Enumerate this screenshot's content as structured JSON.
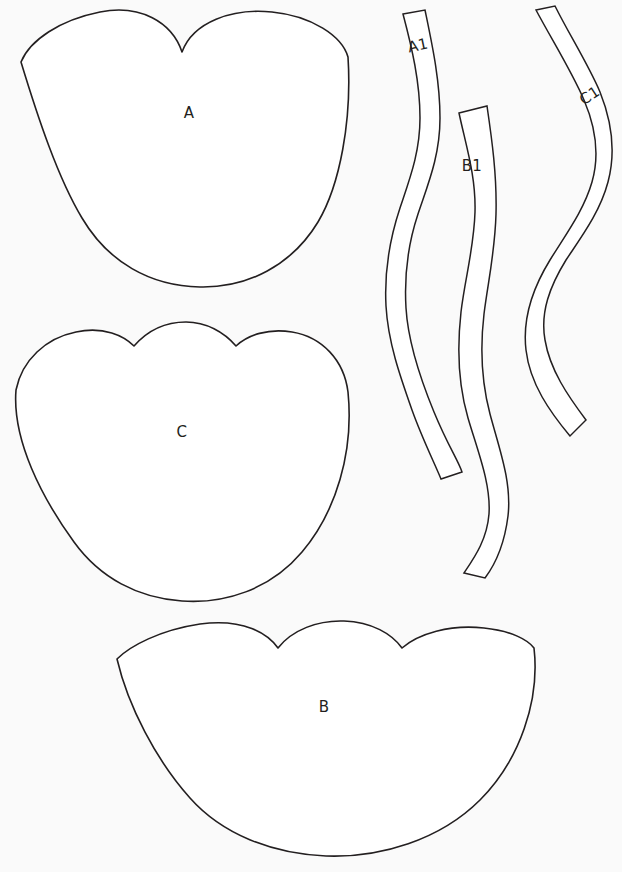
{
  "sheet": {
    "title": "Pattern Template Sheet",
    "background_color": "#fafafa",
    "line_color": "#231f20",
    "fill_color": "#ffffff",
    "width": 622,
    "height": 872
  },
  "pieces": [
    {
      "id": "piece-a",
      "label": "A",
      "kind": "body-panel",
      "label_x": 189,
      "label_y": 113,
      "path": "M 21 62 C 30 40 60 20 100 12 C 140 4 172 22 182 52 C 193 22 232 8 272 12 C 312 16 342 36 348 57 C 352 120 340 185 318 222 C 292 265 248 288 200 287 C 150 286 108 262 82 218 C 58 178 38 118 21 62 Z"
    },
    {
      "id": "piece-c",
      "label": "C",
      "kind": "body-panel",
      "label_x": 182,
      "label_y": 432,
      "path": "M 16 390 C 22 360 46 338 76 332 C 104 326 124 336 134 346 C 148 330 166 322 186 322 C 206 322 224 332 236 346 C 248 335 268 328 292 332 C 322 337 344 360 348 392 C 354 452 336 512 302 552 C 270 590 224 604 182 601 C 138 598 100 578 74 542 C 42 498 12 440 16 390 Z"
    },
    {
      "id": "piece-b",
      "label": "B",
      "kind": "body-panel",
      "label_x": 324,
      "label_y": 707,
      "path": "M 117 659 C 130 646 160 630 200 624 C 244 618 268 634 278 648 C 292 630 318 620 344 621 C 372 622 392 634 402 648 C 418 634 450 624 484 628 C 512 631 528 640 534 648 C 540 700 520 760 480 800 C 440 840 380 858 326 856 C 272 854 222 834 190 798 C 156 760 128 706 117 659 Z"
    }
  ],
  "strips": [
    {
      "id": "strip-a1",
      "label": "A1",
      "kind": "gusset-strip",
      "label_x": 418,
      "label_y": 46,
      "label_rotation": -12,
      "path": "M 403 14 L 425 10 C 432 44 440 80 440 118 C 440 156 428 184 418 214 C 408 244 404 274 406 308 C 408 342 420 378 434 412 C 448 446 458 460 462 472 L 441 479 C 434 462 422 438 412 410 C 400 376 388 342 386 306 C 384 268 390 238 400 208 C 410 178 420 152 420 118 C 420 82 412 48 403 14 Z"
    },
    {
      "id": "strip-b1",
      "label": "B1",
      "kind": "gusset-strip",
      "label_x": 472,
      "label_y": 166,
      "label_rotation": 0,
      "path": "M 459 113 L 487 106 C 492 140 497 176 496 214 C 495 252 488 282 484 314 C 480 348 481 380 490 414 C 499 448 512 482 508 516 C 504 548 494 566 485 578 L 464 573 C 474 558 487 540 489 514 C 491 484 478 452 468 418 C 458 384 457 348 461 312 C 465 278 474 248 475 212 C 476 176 466 146 459 113 Z"
    },
    {
      "id": "strip-c1",
      "label": "C1",
      "kind": "gusset-strip",
      "label_x": 590,
      "label_y": 96,
      "label_rotation": -33,
      "path": "M 536 10 L 555 6 C 570 36 588 64 600 92 C 612 122 616 152 608 182 C 600 212 582 236 566 260 C 550 286 540 312 545 340 C 550 370 568 396 586 420 L 570 436 C 550 412 530 384 526 350 C 522 316 534 286 550 260 C 566 234 584 210 592 182 C 600 154 596 128 584 100 C 572 72 552 40 536 10 Z"
    }
  ],
  "footer": {
    "note": ""
  }
}
